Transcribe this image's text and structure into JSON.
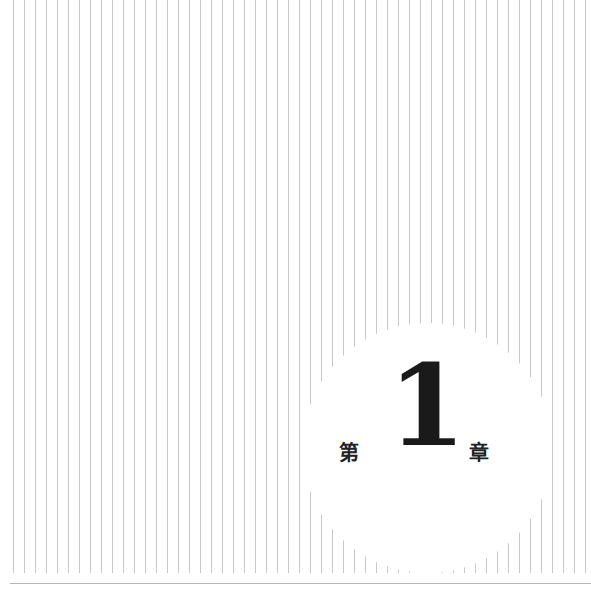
{
  "page": {
    "type": "chapter-title-page",
    "background": "#ffffff",
    "stripe_color": "#c9c9c9",
    "rule_color": "#b5b5b5"
  },
  "chapter": {
    "prefix": "第",
    "number": "1",
    "suffix": "章"
  },
  "decoration": {
    "stripes": {
      "start_x": 13,
      "spacing": 11,
      "bottom_y": 573
    },
    "circle": {
      "cx": 427,
      "cy": 448,
      "r": 125
    }
  }
}
